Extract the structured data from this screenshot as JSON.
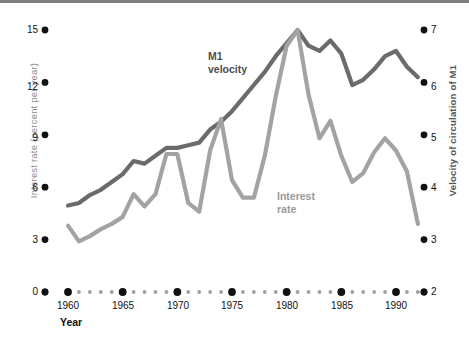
{
  "chart_data": {
    "type": "line",
    "title": "",
    "xlabel": "Year",
    "ylabel": "Interest rate (percent per year)",
    "ylabel_right": "Velocity of circulation of M1",
    "xlim": [
      1959,
      1992
    ],
    "ylim": [
      0,
      15
    ],
    "ylim_right": [
      2,
      7
    ],
    "yticks": [
      0,
      3,
      6,
      9,
      12,
      15
    ],
    "yticks_right": [
      2,
      3,
      4,
      5,
      6,
      7
    ],
    "xticks": [
      1960,
      1965,
      1970,
      1975,
      1980,
      1985,
      1990
    ],
    "xtick_labels": [
      "1960",
      "1965",
      "1970",
      "1975",
      "1980",
      "1985",
      "1990"
    ],
    "grid": false,
    "legend_position": "inline-annotations",
    "x": [
      1960,
      1961,
      1962,
      1963,
      1964,
      1965,
      1966,
      1967,
      1968,
      1969,
      1970,
      1971,
      1972,
      1973,
      1974,
      1975,
      1976,
      1977,
      1978,
      1979,
      1980,
      1981,
      1982,
      1983,
      1984,
      1985,
      1986,
      1987,
      1988,
      1989,
      1990,
      1991,
      1992
    ],
    "series": [
      {
        "name": "M1 velocity",
        "axis": "right",
        "color": "#6b6b6b",
        "values": [
          3.65,
          3.7,
          3.85,
          3.95,
          4.1,
          4.25,
          4.5,
          4.45,
          4.6,
          4.75,
          4.75,
          4.8,
          4.85,
          5.1,
          5.25,
          5.45,
          5.7,
          5.95,
          6.2,
          6.5,
          6.75,
          7.0,
          6.7,
          6.6,
          6.8,
          6.55,
          5.95,
          6.05,
          6.25,
          6.5,
          6.6,
          6.3,
          6.1
        ]
      },
      {
        "name": "Interest rate",
        "axis": "left",
        "color": "#a3a3a3",
        "values": [
          3.8,
          2.9,
          3.2,
          3.6,
          3.9,
          4.3,
          5.6,
          4.9,
          5.6,
          7.9,
          7.9,
          5.1,
          4.6,
          8.1,
          9.9,
          6.4,
          5.4,
          5.4,
          7.8,
          11.2,
          14.1,
          15.0,
          11.3,
          8.8,
          9.8,
          7.8,
          6.3,
          6.8,
          8.0,
          8.8,
          8.1,
          6.9,
          3.9
        ]
      }
    ],
    "annotations": [
      {
        "text": "M1",
        "second_line": "velocity",
        "series": "M1 velocity"
      },
      {
        "text": "Interest",
        "second_line": "rate",
        "series": "Interest rate"
      }
    ],
    "colors": {
      "velocity_line": "#6b6b6b",
      "interest_line": "#a3a3a3",
      "tick_dot": "#111111",
      "minor_dot": "#a0a0a0",
      "left_axis_label": "#8c8c8c",
      "right_axis_label": "#555555",
      "top_rule": "#7f7f7f"
    }
  },
  "labels": {
    "axis_left": "Interest rate (percent per year)",
    "axis_right": "Velocity of circulation of M1",
    "x_title": "Year",
    "m1_line1": "M1",
    "m1_line2": "velocity",
    "interest_line1": "Interest",
    "interest_line2": "rate",
    "y_0": "0",
    "y_3": "3",
    "y_6": "6",
    "y_9": "9",
    "y_12": "12",
    "y_15": "15",
    "yr_2": "2",
    "yr_3": "3",
    "yr_4": "4",
    "yr_5": "5",
    "yr_6": "6",
    "yr_7": "7",
    "x_1960": "1960",
    "x_1965": "1965",
    "x_1970": "1970",
    "x_1975": "1975",
    "x_1980": "1980",
    "x_1985": "1985",
    "x_1990": "1990"
  }
}
